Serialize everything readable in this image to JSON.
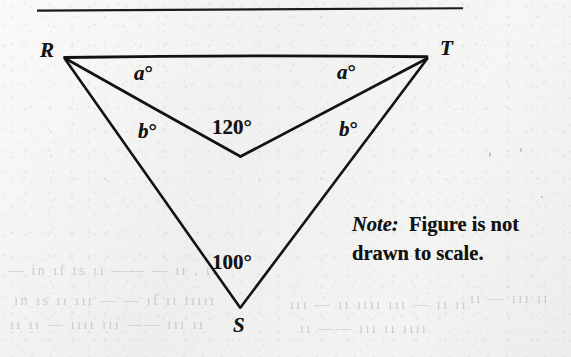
{
  "figure": {
    "rule": {
      "name": "top-horizontal-rule"
    },
    "vertices": [
      {
        "id": "R",
        "label": "R",
        "x": 64,
        "y": 57,
        "label_x": 40,
        "label_y": 40
      },
      {
        "id": "T",
        "label": "T",
        "x": 427,
        "y": 57,
        "label_x": 440,
        "label_y": 38
      },
      {
        "id": "S",
        "label": "S",
        "x": 240,
        "y": 307,
        "label_x": 233,
        "label_y": 315
      },
      {
        "id": "V",
        "label": "",
        "x": 240,
        "y": 156,
        "label_x": 0,
        "label_y": 0
      }
    ],
    "segments": [
      {
        "name": "segment-RT",
        "from": "R",
        "to": "T"
      },
      {
        "name": "segment-RV",
        "from": "R",
        "to": "V"
      },
      {
        "name": "segment-VT",
        "from": "V",
        "to": "T"
      },
      {
        "name": "segment-RS",
        "from": "R",
        "to": "S"
      },
      {
        "name": "segment-ST",
        "from": "S",
        "to": "T"
      }
    ],
    "angle_labels": [
      {
        "name": "angle-label-a-left",
        "text": "a°",
        "italic_part": "a",
        "x": 134,
        "y": 63,
        "style": "variable"
      },
      {
        "name": "angle-label-a-right",
        "text": "a°",
        "italic_part": "a",
        "x": 337,
        "y": 62,
        "style": "variable"
      },
      {
        "name": "angle-label-b-left",
        "text": "b°",
        "italic_part": "b",
        "x": 138,
        "y": 121,
        "style": "variable"
      },
      {
        "name": "angle-label-b-right",
        "text": "b°",
        "italic_part": "b",
        "x": 339,
        "y": 119,
        "style": "variable"
      },
      {
        "name": "angle-label-120",
        "text": "120°",
        "italic_part": "",
        "x": 212,
        "y": 117,
        "style": "numeric"
      },
      {
        "name": "angle-label-100",
        "text": "100°",
        "italic_part": "",
        "x": 212,
        "y": 252,
        "style": "numeric"
      }
    ]
  },
  "note": {
    "prefix": "Note:",
    "body": "Figure is not drawn to scale."
  },
  "colors": {
    "ink": "#141414",
    "paper": "#f2f2f1",
    "rule": "#1a1a1a"
  },
  "bleed_text": [
    {
      "text": "— in  ıf ts     ıı ——     —  ıı  ,     ıı",
      "x": 8,
      "y": 262
    },
    {
      "text": "ın  ıs ıı ııı —   —  ıf  ıı  ııııı",
      "x": 14,
      "y": 292
    },
    {
      "text": "ıı ıı —  ıııı  ııı  ——   ııı  ıı",
      "x": 10,
      "y": 316
    },
    {
      "text": "ııı  —  ıı ıııı   ııı — ıı ıı",
      "x": 290,
      "y": 296
    },
    {
      "text": "ıı ——  ııı  ıı ıııı",
      "x": 300,
      "y": 320
    },
    {
      "text": "ıı —  ııı ıı",
      "x": 470,
      "y": 290
    }
  ]
}
